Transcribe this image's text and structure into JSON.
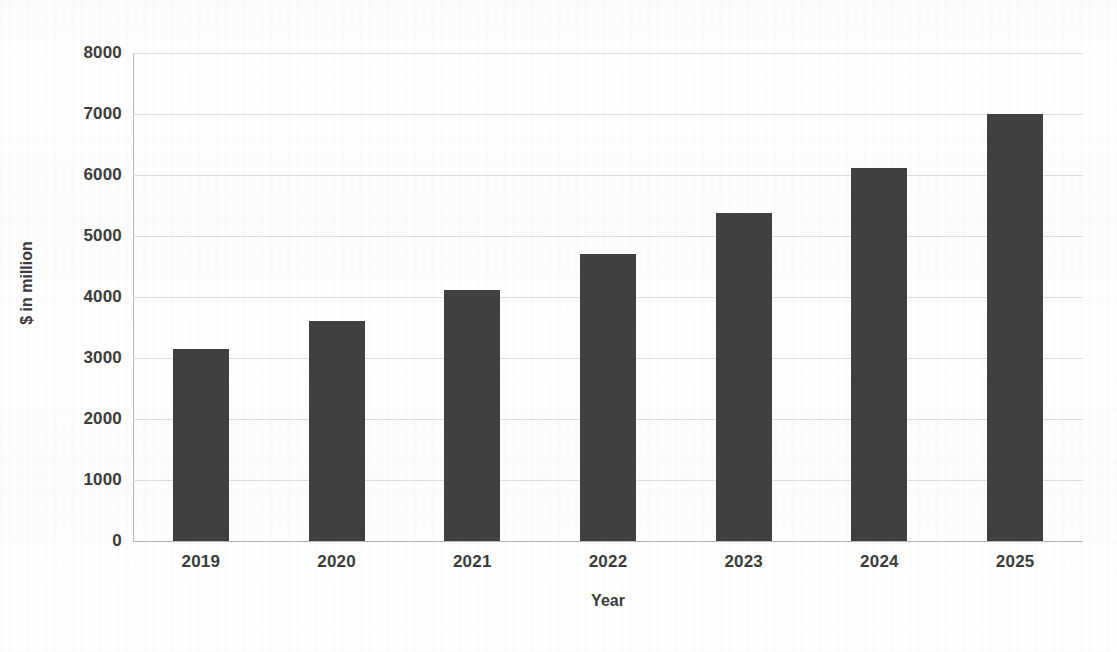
{
  "chart_data": {
    "type": "bar",
    "title": "",
    "xlabel": "Year",
    "ylabel": "$ in million",
    "categories": [
      "2019",
      "2020",
      "2021",
      "2022",
      "2023",
      "2024",
      "2025"
    ],
    "values": [
      3150,
      3600,
      4120,
      4700,
      5380,
      6120,
      7000
    ],
    "ylim": [
      0,
      8000
    ],
    "ytick_labels": [
      "8000",
      "7000",
      "6000",
      "5000",
      "4000",
      "3000",
      "2000",
      "1000",
      "0"
    ],
    "ytick_values": [
      8000,
      7000,
      6000,
      5000,
      4000,
      3000,
      2000,
      1000,
      0
    ],
    "grid": true,
    "grid_axis": "y",
    "legend": false,
    "legend_position": "none",
    "series": [
      {
        "name": "$ in million",
        "values": [
          3150,
          3600,
          4120,
          4700,
          5380,
          6120,
          7000
        ],
        "color": "#404040"
      }
    ]
  },
  "colors": {
    "bar": "#404040",
    "gridline": "#dcdcdc",
    "axis": "#b8b8b8",
    "text": "#3c3c3c",
    "background": "#ffffff"
  }
}
